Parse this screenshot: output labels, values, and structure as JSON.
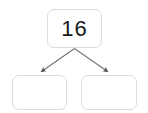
{
  "diagram": {
    "type": "number-bond-decomposition",
    "whole": {
      "label": "16",
      "value": 16
    },
    "parts": [
      {
        "label": "",
        "value": null
      },
      {
        "label": "",
        "value": null
      }
    ],
    "connectors": [
      {
        "from": "whole",
        "to": "part-left",
        "style": "arrow"
      },
      {
        "from": "whole",
        "to": "part-right",
        "style": "arrow"
      }
    ],
    "colors": {
      "background": "#ffffff",
      "box_border": "#dcdcdc",
      "box_fill": "#ffffff",
      "text": "#1a1a1a",
      "connector": "#777777",
      "arrowhead": "#555555"
    }
  }
}
